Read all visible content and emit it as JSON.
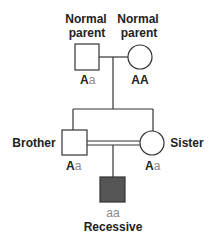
{
  "diagram": {
    "type": "pedigree",
    "colors": {
      "line": "#333333",
      "affected_fill": "#555555",
      "recessive_allele_text": "#8a8a8a",
      "label_text": "#222222"
    },
    "generation1": {
      "father": {
        "label_line1": "Normal",
        "label_line2": "parent",
        "shape": "square",
        "genotype_dominant": "A",
        "genotype_recessive": "a"
      },
      "mother": {
        "label_line1": "Normal",
        "label_line2": "parent",
        "shape": "circle",
        "genotype_dominant": "AA",
        "genotype_recessive": ""
      }
    },
    "generation2": {
      "brother": {
        "label": "Brother",
        "shape": "square",
        "genotype_dominant": "A",
        "genotype_recessive": "a"
      },
      "sister": {
        "label": "Sister",
        "shape": "circle",
        "genotype_dominant": "A",
        "genotype_recessive": "a"
      },
      "union": "consanguineous (double line)"
    },
    "generation3": {
      "child": {
        "genotype_recessive": "aa",
        "label": "Recessive",
        "shape": "square",
        "affected": true
      }
    }
  }
}
